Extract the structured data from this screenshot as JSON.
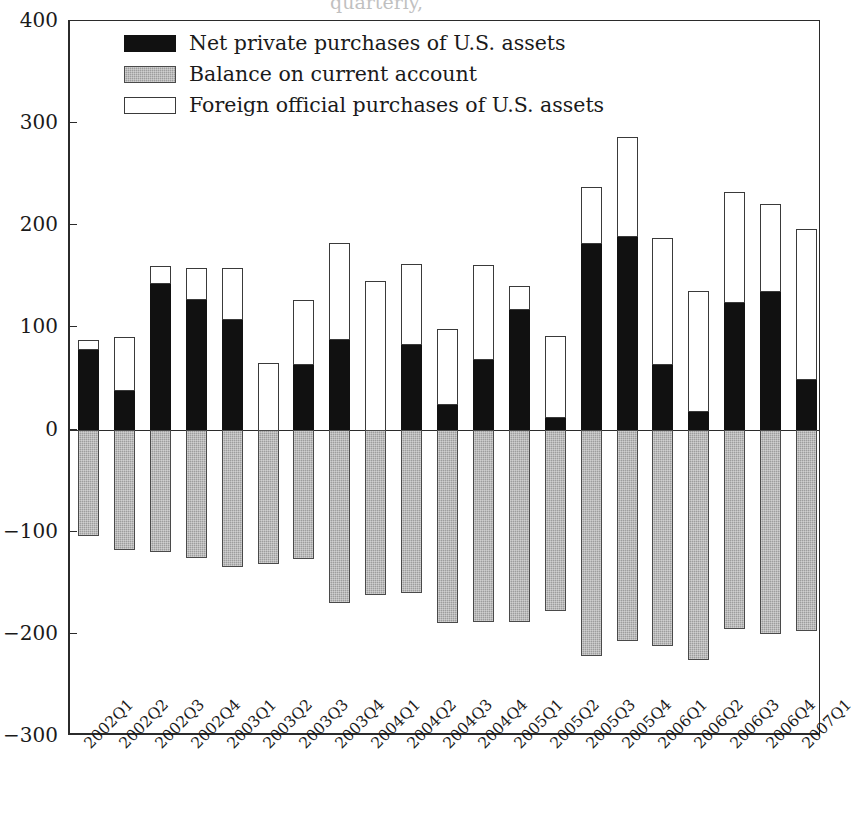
{
  "chart_data": {
    "type": "bar",
    "stacked": true,
    "title": "",
    "title_clipped_remnant": "quarterly,",
    "xlabel": "",
    "ylabel": "",
    "ylim": [
      -300,
      400
    ],
    "yticks": [
      400,
      300,
      200,
      100,
      0,
      -100,
      -200,
      -300
    ],
    "ytick_labels": [
      "400",
      "300",
      "200",
      "100",
      "0",
      "−100",
      "−200",
      "−300"
    ],
    "grid": false,
    "legend_position": "upper-left-inside",
    "categories": [
      "2002Q1",
      "2002Q2",
      "2002Q3",
      "2002Q4",
      "2003Q1",
      "2003Q2",
      "2003Q3",
      "2003Q4",
      "2004Q1",
      "2004Q2",
      "2004Q3",
      "2004Q4",
      "2005Q1",
      "2005Q2",
      "2005Q3",
      "2005Q4",
      "2006Q1",
      "2006Q2",
      "2006Q3",
      "2006Q4",
      "2007Q1"
    ],
    "series": [
      {
        "name": "Net private purchases of U.S. assets",
        "color": "#111111",
        "fill": "solid-black",
        "values": [
          78,
          38,
          143,
          127,
          107,
          -5,
          63,
          88,
          -30,
          83,
          24,
          68,
          117,
          11,
          182,
          189,
          63,
          17,
          124,
          135,
          49
        ]
      },
      {
        "name": "Balance on current account",
        "color": "#9d9d9d",
        "fill": "gray-hatch",
        "values": [
          -104,
          -118,
          -120,
          -126,
          -135,
          -132,
          -127,
          -170,
          -162,
          -160,
          -189,
          -188,
          -188,
          -178,
          -222,
          -207,
          -212,
          -226,
          -195,
          -200,
          -197
        ]
      },
      {
        "name": "Foreign official purchases of U.S. assets",
        "color": "#ffffff",
        "fill": "white-outline",
        "stacked_on": "Net private purchases of U.S. assets",
        "values": [
          10,
          53,
          17,
          31,
          51,
          70,
          64,
          95,
          175,
          79,
          74,
          93,
          24,
          81,
          55,
          97,
          125,
          119,
          109,
          86,
          147
        ]
      }
    ],
    "stack_tops": [
      88,
      91,
      160,
      158,
      158,
      65,
      127,
      183,
      145,
      162,
      98,
      161,
      141,
      92,
      237,
      286,
      188,
      136,
      233,
      221,
      196
    ]
  },
  "legend": {
    "items": [
      {
        "label": "Net private purchases of U.S. assets",
        "swatch": "black-filled-swatch"
      },
      {
        "label": "Balance on current account",
        "swatch": "gray-hatched-swatch"
      },
      {
        "label": "Foreign official purchases of U.S. assets",
        "swatch": "white-outlined-swatch"
      }
    ]
  }
}
